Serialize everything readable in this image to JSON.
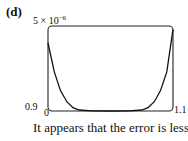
{
  "panel_label": "(d)",
  "axes": {
    "y_max_label": "5 × 10",
    "y_max_exponent": "−6",
    "x_min_label": "0.9",
    "y_min_label": "0",
    "x_max_label": "1.1"
  },
  "caption": "It appears that the error is less",
  "chart_data": {
    "type": "line",
    "title": "(d)",
    "xlabel": "",
    "ylabel": "",
    "xlim": [
      0.9,
      1.1
    ],
    "ylim": [
      0,
      5e-06
    ],
    "x_tick_labels": [
      "0.9",
      "1.1"
    ],
    "y_tick_labels": [
      "0",
      "5 × 10^-6"
    ],
    "grid": false,
    "legend": null,
    "series": [
      {
        "name": "error",
        "x": [
          0.9,
          0.91,
          0.92,
          0.93,
          0.94,
          0.95,
          0.97,
          1.0,
          1.03,
          1.05,
          1.06,
          1.07,
          1.08,
          1.09,
          1.1
        ],
        "y": [
          4e-06,
          2.3e-06,
          1.2e-06,
          5.5e-07,
          2e-07,
          6e-08,
          5e-09,
          0.0,
          5e-09,
          6e-08,
          2e-07,
          5.5e-07,
          1.2e-06,
          2.3e-06,
          4.8e-06
        ]
      }
    ],
    "annotations": [
      "It appears that the error is less"
    ]
  }
}
